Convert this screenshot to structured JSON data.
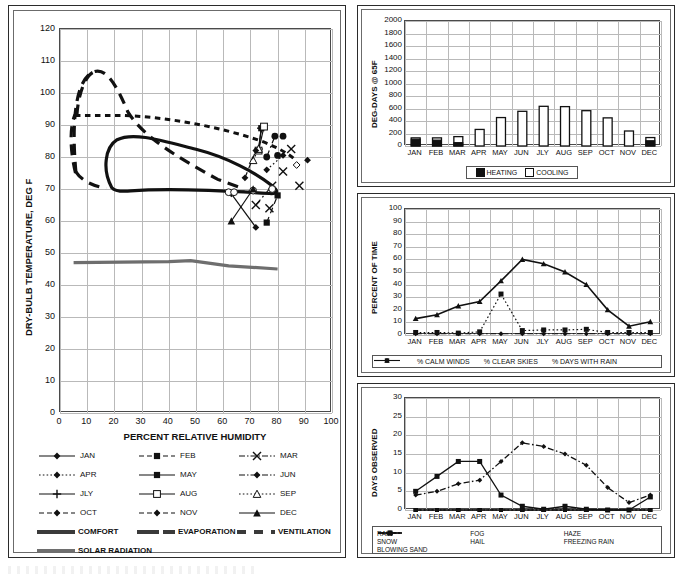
{
  "chart_data": [
    {
      "id": "psychrometric",
      "type": "scatter",
      "title": "",
      "xlabel": "PERCENT RELATIVE HUMIDITY",
      "ylabel": "DRY-BULB TEMPERATURE, DEG F",
      "xlim": [
        0,
        100
      ],
      "ylim": [
        0,
        120
      ],
      "xticks": [
        "0",
        "10",
        "20",
        "30",
        "40",
        "50",
        "60",
        "70",
        "80",
        "90",
        "100"
      ],
      "yticks": [
        "0",
        "10",
        "20",
        "30",
        "40",
        "50",
        "60",
        "70",
        "80",
        "90",
        "100",
        "110",
        "120"
      ],
      "grid": true,
      "legend_position": "below-axis",
      "monthly_segments": [
        {
          "name": "JAN",
          "style": "solid-diamond",
          "x": [
            63,
            72
          ],
          "y": [
            68.5,
            58.0
          ]
        },
        {
          "name": "FEB",
          "style": "dash-square",
          "x": [
            76,
            80
          ],
          "y": [
            59.5,
            68.0
          ]
        },
        {
          "name": "MAR",
          "style": "dashdot-x",
          "x": [
            72,
            78
          ],
          "y": [
            65.0,
            71.0
          ]
        },
        {
          "name": "APR",
          "style": "dot-diamond",
          "x": [
            76,
            82
          ],
          "y": [
            76.0,
            80.5
          ]
        },
        {
          "name": "MAY",
          "style": "solid-square",
          "x": [
            73,
            74
          ],
          "y": [
            82.0,
            89.0
          ]
        },
        {
          "name": "JUN",
          "style": "dashdot-circle",
          "x": [
            76,
            79
          ],
          "y": [
            80.0,
            86.5
          ]
        },
        {
          "name": "JLY",
          "style": "solid-plus",
          "x": [
            73,
            74
          ],
          "y": [
            82.5,
            89.0
          ]
        },
        {
          "name": "AUG",
          "style": "solid-opensquare",
          "x": [
            73,
            75
          ],
          "y": [
            82.0,
            89.5
          ]
        },
        {
          "name": "SEP",
          "style": "dot-opentriangle",
          "x": [
            71,
            73
          ],
          "y": [
            79.0,
            82.5
          ]
        },
        {
          "name": "OCT",
          "style": "dash-diamond",
          "x": [
            68,
            72
          ],
          "y": [
            73.5,
            82.0
          ]
        },
        {
          "name": "NOV",
          "style": "dash-opencircle",
          "x": [
            62,
            71
          ],
          "y": [
            69.0,
            69.5
          ]
        },
        {
          "name": "DEC",
          "style": "solid-triangle",
          "x": [
            63,
            71
          ],
          "y": [
            60.0,
            70.0
          ]
        }
      ],
      "zones": [
        {
          "name": "COMFORT",
          "style": "thick-solid",
          "note": "closed region ~20-80% RH, 69-86 F"
        },
        {
          "name": "EVAPORATION",
          "style": "thick-longdash",
          "note": "closed region ~5-45% RH up to 106 F"
        },
        {
          "name": "VENTILATION",
          "style": "thick-shortdash",
          "note": "region bounded near 93 F top, extends to ~85% RH"
        },
        {
          "name": "SOLAR RADIATION",
          "style": "thick-solid-gray",
          "note": "near-horizontal line at ~47 F falling to ~45 F"
        }
      ],
      "legend": [
        {
          "label": "JAN",
          "style": "solid-diamond"
        },
        {
          "label": "FEB",
          "style": "dash-square"
        },
        {
          "label": "MAR",
          "style": "dashdot-x"
        },
        {
          "label": "APR",
          "style": "dot-diamond"
        },
        {
          "label": "MAY",
          "style": "solid-square"
        },
        {
          "label": "JUN",
          "style": "dashdot-circle"
        },
        {
          "label": "JLY",
          "style": "solid-plus"
        },
        {
          "label": "AUG",
          "style": "solid-opensquare"
        },
        {
          "label": "SEP",
          "style": "dot-opentriangle"
        },
        {
          "label": "OCT",
          "style": "dash-diamond"
        },
        {
          "label": "NOV",
          "style": "dash-opencircle"
        },
        {
          "label": "DEC",
          "style": "solid-triangle"
        },
        {
          "label": "COMFORT",
          "style": "thick-solid"
        },
        {
          "label": "EVAPORATION",
          "style": "thick-longdash"
        },
        {
          "label": "VENTILATION",
          "style": "thick-shortdash"
        },
        {
          "label": "SOLAR RADIATION",
          "style": "thick-solid-gray"
        }
      ]
    },
    {
      "id": "degree-days",
      "type": "bar",
      "title": "",
      "xlabel": "",
      "ylabel": "DEG-DAYS @ 65F",
      "categories": [
        "JAN",
        "FEB",
        "MAR",
        "APR",
        "MAY",
        "JUN",
        "JLY",
        "AUG",
        "SEP",
        "OCT",
        "NOV",
        "DEC"
      ],
      "ylim": [
        0,
        2000
      ],
      "yticks": [
        "0",
        "200",
        "400",
        "600",
        "800",
        "1000",
        "1200",
        "1400",
        "1600",
        "1800",
        "2000"
      ],
      "grid": true,
      "legend_position": "bottom",
      "series": [
        {
          "name": "HEATING",
          "fill": "black",
          "values": [
            110,
            95,
            55,
            0,
            0,
            0,
            0,
            0,
            0,
            0,
            0,
            85
          ]
        },
        {
          "name": "COOLING",
          "fill": "white",
          "values": [
            130,
            130,
            150,
            265,
            455,
            555,
            635,
            630,
            565,
            450,
            240,
            135
          ]
        }
      ]
    },
    {
      "id": "percent-of-time",
      "type": "line",
      "title": "",
      "xlabel": "",
      "ylabel": "PERCENT OF TIME",
      "categories": [
        "JAN",
        "FEB",
        "MAR",
        "APR",
        "MAY",
        "JUN",
        "JLY",
        "AUG",
        "SEP",
        "OCT",
        "NOV",
        "DEC"
      ],
      "ylim": [
        0,
        100
      ],
      "yticks": [
        "0",
        "10",
        "20",
        "30",
        "40",
        "50",
        "60",
        "70",
        "80",
        "90",
        "100"
      ],
      "grid": true,
      "legend_position": "bottom",
      "series": [
        {
          "name": "% CALM WINDS",
          "style": "dotted-square",
          "values": [
            2,
            2,
            1.5,
            2.5,
            32.5,
            3.5,
            4,
            4,
            4.5,
            2,
            2,
            2
          ]
        },
        {
          "name": "% CLEAR SKIES",
          "style": "dashdot-diamond",
          "values": [
            1,
            1,
            1,
            1,
            1,
            1,
            1,
            1,
            1,
            1,
            1,
            1
          ]
        },
        {
          "name": "% DAYS WITH RAIN",
          "style": "solid-triangle",
          "values": [
            13,
            16,
            23,
            26.5,
            43,
            60,
            56.5,
            50,
            40,
            20,
            7,
            10.5
          ]
        }
      ]
    },
    {
      "id": "days-observed",
      "type": "line",
      "title": "",
      "xlabel": "",
      "ylabel": "DAYS OBSERVED",
      "categories": [
        "JAN",
        "FEB",
        "MAR",
        "APR",
        "MAY",
        "JUN",
        "JLY",
        "AUG",
        "SEP",
        "OCT",
        "NOV",
        "DEC"
      ],
      "ylim": [
        0,
        30
      ],
      "yticks": [
        "0",
        "5",
        "10",
        "15",
        "20",
        "25",
        "30"
      ],
      "grid": true,
      "legend_position": "bottom",
      "series": [
        {
          "name": "RAIN",
          "style": "dashdot-diamond",
          "values": [
            4,
            5,
            7,
            8,
            13,
            18,
            17,
            15,
            12,
            6,
            2,
            4
          ]
        },
        {
          "name": "FOG",
          "style": "solid-square",
          "values": [
            5,
            9,
            13,
            13,
            4,
            1,
            0.2,
            1,
            0.2,
            0,
            0,
            3.5
          ]
        },
        {
          "name": "HAZE",
          "style": "dot-triangle",
          "values": [
            0,
            0,
            0,
            0,
            0,
            0,
            0,
            0,
            0,
            0,
            0,
            0
          ]
        },
        {
          "name": "SNOW",
          "style": "dot-opensquare",
          "values": [
            0,
            0,
            0,
            0,
            0,
            0,
            0,
            0,
            0,
            0,
            0,
            0
          ]
        },
        {
          "name": "HAIL",
          "style": "solid-square2",
          "values": [
            0,
            0,
            0,
            0,
            0,
            0,
            0,
            0,
            0,
            0,
            0,
            0
          ]
        },
        {
          "name": "FREEZING RAIN",
          "style": "solid-circle",
          "values": [
            0,
            0,
            0,
            0,
            0,
            0,
            0,
            0,
            0,
            0,
            0,
            0
          ]
        },
        {
          "name": "BLOWING SAND",
          "style": "dashdot-x",
          "values": [
            0,
            0,
            0,
            0,
            0,
            0,
            0,
            0,
            0,
            0,
            0,
            0
          ]
        }
      ]
    }
  ],
  "main_chart": {
    "ylabel": "DRY-BULB TEMPERATURE, DEG F",
    "xlabel": "PERCENT RELATIVE HUMIDITY",
    "yticks": [
      "120",
      "110",
      "100",
      "90",
      "80",
      "70",
      "60",
      "50",
      "40",
      "30",
      "20",
      "10",
      "0"
    ],
    "xticks": [
      "0",
      "10",
      "20",
      "30",
      "40",
      "50",
      "60",
      "70",
      "80",
      "90",
      "100"
    ],
    "legend": {
      "rows": [
        [
          {
            "label": "JAN"
          },
          {
            "label": "FEB"
          },
          {
            "label": "MAR"
          }
        ],
        [
          {
            "label": "APR"
          },
          {
            "label": "MAY"
          },
          {
            "label": "JUN"
          }
        ],
        [
          {
            "label": "JLY"
          },
          {
            "label": "AUG"
          },
          {
            "label": "SEP"
          }
        ],
        [
          {
            "label": "OCT"
          },
          {
            "label": "NOV"
          },
          {
            "label": "DEC"
          }
        ],
        [
          {
            "label": "COMFORT"
          },
          {
            "label": "EVAPORATION"
          },
          {
            "label": "VENTILATION"
          }
        ],
        [
          {
            "label": "SOLAR RADIATION"
          }
        ]
      ]
    }
  },
  "degday_chart": {
    "ylabel": "DEG-DAYS @ 65F",
    "yticks": [
      "2000",
      "1800",
      "1600",
      "1400",
      "1200",
      "1000",
      "800",
      "600",
      "400",
      "200",
      "0"
    ],
    "xticks": [
      "JAN",
      "FEB",
      "MAR",
      "APR",
      "MAY",
      "JUN",
      "JLY",
      "AUG",
      "SEP",
      "OCT",
      "NOV",
      "DEC"
    ],
    "legend": [
      "HEATING",
      "COOLING"
    ]
  },
  "pct_chart": {
    "ylabel": "PERCENT OF TIME",
    "yticks": [
      "100",
      "90",
      "80",
      "70",
      "60",
      "50",
      "40",
      "30",
      "20",
      "10",
      "0"
    ],
    "xticks": [
      "JAN",
      "FEB",
      "MAR",
      "APR",
      "MAY",
      "JUN",
      "JLY",
      "AUG",
      "SEP",
      "OCT",
      "NOV",
      "DEC"
    ],
    "legend": [
      "% CALM WINDS",
      "% CLEAR SKIES",
      "% DAYS WITH RAIN"
    ]
  },
  "days_chart": {
    "ylabel": "DAYS OBSERVED",
    "yticks": [
      "30",
      "25",
      "20",
      "15",
      "10",
      "5",
      "0"
    ],
    "xticks": [
      "JAN",
      "FEB",
      "MAR",
      "APR",
      "MAY",
      "JUN",
      "JLY",
      "AUG",
      "SEP",
      "OCT",
      "NOV",
      "DEC"
    ],
    "legend": [
      "RAIN",
      "FOG",
      "HAZE",
      "SNOW",
      "HAIL",
      "FREEZING RAIN",
      "BLOWING SAND"
    ]
  },
  "colors": {
    "ink": "#111111",
    "grid": "#b9b9b9",
    "axis": "#4a4a4a",
    "gray_line": "#6e6e6e"
  }
}
